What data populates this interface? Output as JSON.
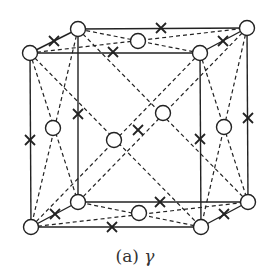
{
  "caption": {
    "label": "(a)",
    "symbol": "γ"
  },
  "colors": {
    "line": "#222222",
    "atom_fill": "#ffffff"
  },
  "legend": {
    "circle": "atom-site",
    "cross": "interstitial-site"
  },
  "vertices": {
    "FTL": [
      30,
      53
    ],
    "FTR": [
      200,
      53
    ],
    "FBR": [
      201,
      227
    ],
    "FBL": [
      31,
      227
    ],
    "BTL": [
      78,
      29
    ],
    "BTR": [
      247,
      28
    ],
    "BBR": [
      248,
      202
    ],
    "BBL": [
      78,
      202
    ]
  },
  "face_centers": [
    {
      "name": "left",
      "pos": [
        53,
        128
      ]
    },
    {
      "name": "right",
      "pos": [
        224,
        127
      ]
    },
    {
      "name": "top",
      "pos": [
        138,
        41
      ]
    },
    {
      "name": "bottom",
      "pos": [
        139,
        213
      ]
    },
    {
      "name": "front",
      "pos": [
        114,
        140
      ]
    },
    {
      "name": "back",
      "pos": [
        163,
        113
      ]
    }
  ],
  "crosses": [
    [
      30,
      140
    ],
    [
      78,
      114
    ],
    [
      200,
      139
    ],
    [
      248,
      118
    ],
    [
      161,
      28
    ],
    [
      113,
      52
    ],
    [
      160,
      202
    ],
    [
      112,
      227
    ],
    [
      54,
      41
    ],
    [
      223,
      41
    ],
    [
      55,
      214
    ],
    [
      224,
      214
    ],
    [
      138,
      130
    ]
  ]
}
